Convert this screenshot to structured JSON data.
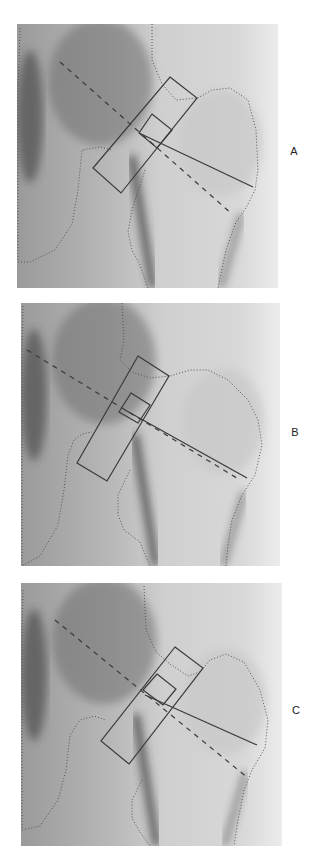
{
  "figure": {
    "panels": [
      {
        "label": "A",
        "box": {
          "x": 17,
          "y": 24,
          "w": 261,
          "h": 264
        },
        "label_pos": {
          "x": 287,
          "y": 145
        },
        "neck_box": [
          [
            170,
            77
          ],
          [
            197,
            98
          ],
          [
            121,
            193
          ],
          [
            93,
            168
          ]
        ],
        "small_box": [
          [
            152,
            114
          ],
          [
            172,
            130
          ],
          [
            157,
            148
          ],
          [
            139,
            133
          ]
        ],
        "solid_line": [
          [
            139,
            133
          ],
          [
            253,
            187
          ]
        ],
        "dashed_line": [
          [
            60,
            62
          ],
          [
            232,
            214
          ]
        ],
        "femur_contour": [
          [
            152,
            24
          ],
          [
            152,
            60
          ],
          [
            162,
            84
          ],
          [
            176,
            100
          ],
          [
            198,
            98
          ],
          [
            212,
            90
          ],
          [
            230,
            88
          ],
          [
            248,
            100
          ],
          [
            256,
            130
          ],
          [
            258,
            170
          ],
          [
            255,
            190
          ],
          [
            246,
            208
          ],
          [
            236,
            222
          ],
          [
            226,
            250
          ],
          [
            218,
            288
          ]
        ],
        "pelvis_contour": [
          [
            20,
            28
          ],
          [
            18,
            100
          ],
          [
            18,
            262
          ],
          [
            30,
            262
          ],
          [
            55,
            250
          ],
          [
            72,
            224
          ],
          [
            78,
            190
          ],
          [
            80,
            170
          ],
          [
            82,
            150
          ],
          [
            100,
            147
          ],
          [
            112,
            150
          ]
        ],
        "shaft_contour": [
          [
            145,
            170
          ],
          [
            132,
            210
          ],
          [
            128,
            232
          ],
          [
            132,
            250
          ],
          [
            140,
            265
          ],
          [
            148,
            288
          ]
        ]
      },
      {
        "label": "B",
        "box": {
          "x": 21,
          "y": 303,
          "w": 259,
          "h": 263
        },
        "label_pos": {
          "x": 288,
          "y": 426
        },
        "neck_box": [
          [
            138,
            356
          ],
          [
            169,
            376
          ],
          [
            107,
            481
          ],
          [
            77,
            463
          ]
        ],
        "small_box": [
          [
            131,
            393
          ],
          [
            150,
            405
          ],
          [
            138,
            423
          ],
          [
            119,
            412
          ]
        ],
        "solid_line": [
          [
            125,
            410
          ],
          [
            247,
            478
          ]
        ],
        "dashed_line": [
          [
            27,
            350
          ],
          [
            240,
            480
          ]
        ],
        "femur_contour": [
          [
            122,
            303
          ],
          [
            124,
            340
          ],
          [
            120,
            360
          ],
          [
            132,
            372
          ],
          [
            150,
            378
          ],
          [
            170,
            376
          ],
          [
            190,
            370
          ],
          [
            208,
            370
          ],
          [
            228,
            380
          ],
          [
            248,
            400
          ],
          [
            258,
            420
          ],
          [
            262,
            445
          ],
          [
            255,
            475
          ],
          [
            242,
            495
          ],
          [
            232,
            520
          ],
          [
            228,
            545
          ],
          [
            226,
            566
          ]
        ],
        "pelvis_contour": [
          [
            23,
            306
          ],
          [
            22,
            360
          ],
          [
            22,
            566
          ],
          [
            40,
            556
          ],
          [
            58,
            525
          ],
          [
            64,
            490
          ],
          [
            68,
            455
          ],
          [
            74,
            440
          ],
          [
            82,
            434
          ],
          [
            92,
            432
          ]
        ],
        "shaft_contour": [
          [
            130,
            470
          ],
          [
            118,
            495
          ],
          [
            118,
            515
          ],
          [
            124,
            530
          ],
          [
            140,
            542
          ],
          [
            150,
            566
          ]
        ]
      },
      {
        "label": "C",
        "box": {
          "x": 21,
          "y": 583,
          "w": 261,
          "h": 263
        },
        "label_pos": {
          "x": 289,
          "y": 704
        },
        "neck_box": [
          [
            175,
            647
          ],
          [
            203,
            668
          ],
          [
            129,
            764
          ],
          [
            101,
            741
          ]
        ],
        "small_box": [
          [
            157,
            674
          ],
          [
            176,
            689
          ],
          [
            163,
            705
          ],
          [
            143,
            690
          ]
        ],
        "solid_line": [
          [
            145,
            695
          ],
          [
            257,
            745
          ]
        ],
        "dashed_line": [
          [
            55,
            620
          ],
          [
            248,
            778
          ]
        ],
        "femur_contour": [
          [
            144,
            586
          ],
          [
            146,
            630
          ],
          [
            156,
            652
          ],
          [
            170,
            664
          ],
          [
            188,
            676
          ],
          [
            200,
            672
          ],
          [
            210,
            660
          ],
          [
            226,
            654
          ],
          [
            244,
            662
          ],
          [
            260,
            690
          ],
          [
            268,
            720
          ],
          [
            265,
            748
          ],
          [
            252,
            770
          ],
          [
            244,
            790
          ],
          [
            238,
            820
          ],
          [
            234,
            846
          ]
        ],
        "pelvis_contour": [
          [
            23,
            590
          ],
          [
            22,
            640
          ],
          [
            22,
            830
          ],
          [
            40,
            826
          ],
          [
            58,
            800
          ],
          [
            66,
            770
          ],
          [
            70,
            735
          ],
          [
            80,
            720
          ],
          [
            94,
            716
          ],
          [
            106,
            720
          ]
        ],
        "shaft_contour": [
          [
            142,
            780
          ],
          [
            132,
            800
          ],
          [
            132,
            818
          ],
          [
            140,
            832
          ],
          [
            150,
            846
          ]
        ]
      }
    ]
  }
}
